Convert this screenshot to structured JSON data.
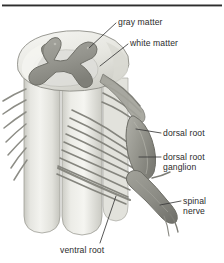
{
  "figure": {
    "style": "grayscale anatomical line illustration",
    "top_rule": true
  },
  "labels": {
    "gray_matter": "gray matter",
    "white_matter": "white matter",
    "dorsal_root": "dorsal root",
    "dorsal_root_ganglion": "dorsal root\nganglion",
    "spinal_nerve": "spinal\nnerve",
    "ventral_root": "ventral root"
  },
  "colors": {
    "gray_matter": "#9a9a93",
    "gray_matter_shadow": "#83837c",
    "white_matter": "#ebebe6",
    "white_matter_shade": "#d6d6cf",
    "cord_body": "#eeeee9",
    "cord_body_shade": "#d2d2cb",
    "rootlets": "#8d8d86",
    "ganglion": "#9b9b94",
    "nerve": "#8f8f88",
    "outline": "#6e6e68",
    "label_text": "#2b2b2b",
    "leader_line": "#3a3a3a",
    "rule": "#2e2e2e",
    "background": "#ffffff"
  },
  "anatomy_parts": [
    "gray matter",
    "white matter",
    "dorsal root",
    "dorsal root ganglion",
    "spinal nerve",
    "ventral root",
    "dorsal rootlets",
    "ventral rootlets"
  ]
}
